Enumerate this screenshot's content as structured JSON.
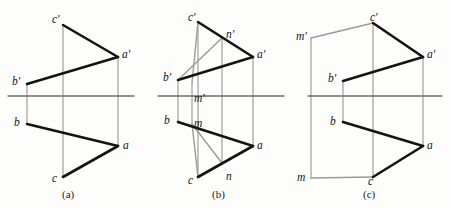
{
  "figure": {
    "title": "",
    "background": "#fdfdfc",
    "colors": {
      "heavy_line": "#141414",
      "thin_line": "#8c8c8c",
      "axis_line": "#6e6e6e",
      "aux_line": "#9a9a9a",
      "text": "#141414"
    },
    "axis_y": 96,
    "panels": [
      {
        "id": "a",
        "caption": "(a)",
        "caption_pos": {
          "x": 62,
          "y": 188
        },
        "points": [
          {
            "key": "c_prime",
            "label": "c'",
            "x": 63,
            "y": 25,
            "label_x": 52,
            "label_y": 13
          },
          {
            "key": "a_prime",
            "label": "a'",
            "x": 118,
            "y": 57,
            "label_x": 122,
            "label_y": 48
          },
          {
            "key": "b_prime",
            "label": "b'",
            "x": 27,
            "y": 84,
            "label_x": 12,
            "label_y": 75
          },
          {
            "key": "b",
            "label": "b",
            "x": 27,
            "y": 124,
            "label_x": 14,
            "label_y": 116
          },
          {
            "key": "a",
            "label": "a",
            "x": 118,
            "y": 146,
            "label_x": 123,
            "label_y": 139
          },
          {
            "key": "c",
            "label": "c",
            "x": 63,
            "y": 177,
            "label_x": 52,
            "label_y": 172
          }
        ],
        "axis": {
          "x1": 8,
          "x2": 134,
          "y": 96
        },
        "heavy_edges": [
          [
            "c_prime",
            "a_prime"
          ],
          [
            "a_prime",
            "b_prime"
          ],
          [
            "b",
            "a"
          ],
          [
            "a",
            "c"
          ]
        ],
        "thin_edges": [
          [
            "c_prime",
            "c"
          ],
          [
            "a_prime",
            "a"
          ],
          [
            "b_prime",
            "b"
          ]
        ],
        "aux_edges": []
      },
      {
        "id": "b",
        "caption": "(b)",
        "caption_pos": {
          "x": 212,
          "y": 188
        },
        "points": [
          {
            "key": "c_prime",
            "label": "c'",
            "x": 198,
            "y": 22,
            "label_x": 188,
            "label_y": 11
          },
          {
            "key": "n_prime",
            "label": "n'",
            "x": 222,
            "y": 38,
            "label_x": 226,
            "label_y": 28
          },
          {
            "key": "a_prime",
            "label": "a'",
            "x": 253,
            "y": 57,
            "label_x": 257,
            "label_y": 48
          },
          {
            "key": "b_prime",
            "label": "b'",
            "x": 178,
            "y": 80,
            "label_x": 163,
            "label_y": 71
          },
          {
            "key": "m_prime",
            "label": "m'",
            "x": 192,
            "y": 83,
            "label_x": 194,
            "label_y": 92
          },
          {
            "key": "b",
            "label": "b",
            "x": 178,
            "y": 122,
            "label_x": 164,
            "label_y": 114
          },
          {
            "key": "m",
            "label": "m",
            "x": 192,
            "y": 124,
            "label_x": 194,
            "label_y": 117
          },
          {
            "key": "a",
            "label": "a",
            "x": 253,
            "y": 146,
            "label_x": 257,
            "label_y": 139
          },
          {
            "key": "n",
            "label": "n",
            "x": 222,
            "y": 163,
            "label_x": 226,
            "label_y": 170
          },
          {
            "key": "c",
            "label": "c",
            "x": 198,
            "y": 177,
            "label_x": 188,
            "label_y": 174
          }
        ],
        "axis": {
          "x1": 158,
          "x2": 284,
          "y": 96
        },
        "heavy_edges": [
          [
            "c_prime",
            "a_prime"
          ],
          [
            "a_prime",
            "b_prime"
          ],
          [
            "b",
            "a"
          ],
          [
            "a",
            "c"
          ]
        ],
        "thin_edges": [
          [
            "c_prime",
            "c"
          ],
          [
            "a_prime",
            "a"
          ],
          [
            "b_prime",
            "b"
          ],
          [
            "n_prime",
            "n"
          ],
          [
            "m_prime",
            "m"
          ]
        ],
        "aux_edges": [
          [
            "b_prime",
            "n_prime"
          ],
          [
            "c_prime",
            "m_prime"
          ],
          [
            "m",
            "n"
          ],
          [
            "m",
            "c"
          ]
        ]
      },
      {
        "id": "c",
        "caption": "(c)",
        "caption_pos": {
          "x": 363,
          "y": 188
        },
        "points": [
          {
            "key": "c_prime",
            "label": "c'",
            "x": 373,
            "y": 23,
            "label_x": 370,
            "label_y": 11
          },
          {
            "key": "m_prime",
            "label": "m'",
            "x": 311,
            "y": 38,
            "label_x": 296,
            "label_y": 30
          },
          {
            "key": "a_prime",
            "label": "a'",
            "x": 423,
            "y": 57,
            "label_x": 427,
            "label_y": 48
          },
          {
            "key": "b_prime",
            "label": "b'",
            "x": 343,
            "y": 81,
            "label_x": 328,
            "label_y": 72
          },
          {
            "key": "b",
            "label": "b",
            "x": 343,
            "y": 122,
            "label_x": 330,
            "label_y": 115
          },
          {
            "key": "a",
            "label": "a",
            "x": 423,
            "y": 146,
            "label_x": 427,
            "label_y": 139
          },
          {
            "key": "m",
            "label": "m",
            "x": 311,
            "y": 178,
            "label_x": 297,
            "label_y": 171
          },
          {
            "key": "c",
            "label": "c",
            "x": 373,
            "y": 177,
            "label_x": 368,
            "label_y": 175
          }
        ],
        "axis": {
          "x1": 308,
          "x2": 442,
          "y": 96
        },
        "heavy_edges": [
          [
            "c_prime",
            "a_prime"
          ],
          [
            "a_prime",
            "b_prime"
          ],
          [
            "b",
            "a"
          ],
          [
            "a",
            "c"
          ]
        ],
        "thin_edges": [
          [
            "c_prime",
            "c"
          ],
          [
            "a_prime",
            "a"
          ],
          [
            "b_prime",
            "b"
          ],
          [
            "m_prime",
            "m"
          ]
        ],
        "aux_edges": [
          [
            "m_prime",
            "c_prime"
          ],
          [
            "m",
            "c"
          ]
        ]
      }
    ]
  }
}
